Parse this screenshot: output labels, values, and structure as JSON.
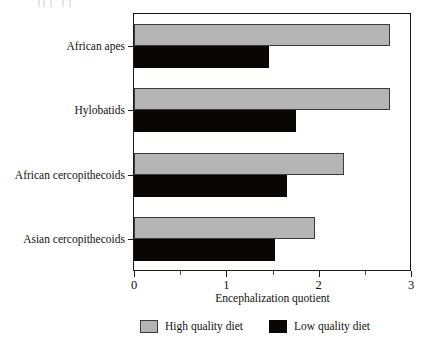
{
  "chart_data": {
    "type": "bar",
    "orientation": "horizontal",
    "title": "",
    "xlabel": "Encephalization quotient",
    "ylabel": "",
    "xlim": [
      0,
      3
    ],
    "xticks": [
      0,
      1,
      2,
      3
    ],
    "xtick_labels": [
      "0",
      "1",
      "2",
      "3"
    ],
    "minor_xticks": [
      0.5,
      1.5,
      2.5
    ],
    "grid": false,
    "legend_position": "bottom",
    "categories": [
      "African apes",
      "Hylobatids",
      "African cercopithecoids",
      "Asian cercopithecoids"
    ],
    "series": [
      {
        "name": "High quality diet",
        "color": "#b4b4b4",
        "values": [
          2.77,
          2.77,
          2.27,
          1.96
        ]
      },
      {
        "name": "Low quality diet",
        "color": "#0a0606",
        "values": [
          1.46,
          1.75,
          1.66,
          1.53
        ]
      }
    ]
  },
  "axis": {
    "x_title": "Encephalization quotient",
    "tick_labels": [
      "0",
      "1",
      "2",
      "3"
    ]
  },
  "category_labels": [
    "African apes",
    "Hylobatids",
    "African cercopithecoids",
    "Asian cercopithecoids"
  ],
  "legend": {
    "entries": [
      {
        "label": "High quality diet",
        "swatch": "high-quality-swatch"
      },
      {
        "label": "Low quality diet",
        "swatch": "low-quality-swatch"
      }
    ]
  },
  "colors": {
    "high_quality": "#b4b4b4",
    "low_quality": "#0a0606",
    "axis": "#1a1a1a",
    "background": "#ffffff"
  }
}
